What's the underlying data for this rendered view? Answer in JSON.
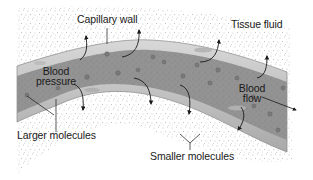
{
  "diagram": {
    "type": "capillary-filtration",
    "labels": {
      "capillary_wall": "Capillary wall",
      "tissue_fluid": "Tissue fluid",
      "blood_pressure_line1": "Blood",
      "blood_pressure_line2": "pressure",
      "blood_flow_line1": "Blood",
      "blood_flow_line2": "flow",
      "larger_molecules": "Larger molecules",
      "smaller_molecules": "Smaller molecules"
    },
    "colors": {
      "vessel_wall": "#c9c9c9",
      "vessel_wall_edge": "#8a8a8a",
      "vessel_lumen": "#8f8f8f",
      "stipple": "#6e6e6e",
      "arrow": "#1a1a1a",
      "text": "#1a1a1a"
    }
  }
}
